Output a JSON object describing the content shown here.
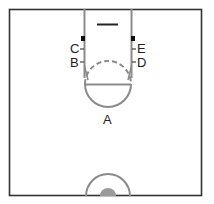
{
  "diagram": {
    "type": "basketball-half-court",
    "colors": {
      "border": "#333333",
      "lines": "#8a8a8a",
      "marker": "#111111",
      "center_fill": "#9a9a9a",
      "text": "#222222"
    },
    "labels": {
      "A": "A",
      "B": "B",
      "C": "C",
      "D": "D",
      "E": "E"
    }
  }
}
